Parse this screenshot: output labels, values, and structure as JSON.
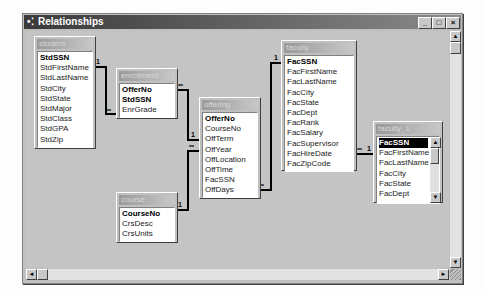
{
  "window": {
    "title": "Relationships",
    "controls": {
      "minimize": "_",
      "maximize": "□",
      "close": "×"
    }
  },
  "tables": {
    "student": {
      "title": "student",
      "fields": [
        "StdSSN",
        "StdFirstName",
        "StdLastName",
        "StdCity",
        "StdState",
        "StdMajor",
        "StdClass",
        "StdGPA",
        "StdZip"
      ]
    },
    "enrollment": {
      "title": "enrollment",
      "fields": [
        "OfferNo",
        "StdSSN",
        "EnrGrade"
      ]
    },
    "offering": {
      "title": "offering",
      "fields": [
        "OfferNo",
        "CourseNo",
        "OffTerm",
        "OffYear",
        "OffLocation",
        "OffTime",
        "FacSSN",
        "OffDays"
      ]
    },
    "faculty": {
      "title": "faculty",
      "fields": [
        "FacSSN",
        "FacFirstName",
        "FacLastName",
        "FacCity",
        "FacState",
        "FacDept",
        "FacRank",
        "FacSalary",
        "FacSupervisor",
        "FacHireDate",
        "FacZipCode"
      ]
    },
    "faculty_1": {
      "title": "faculty_1",
      "fields": [
        "FacSSN",
        "FacFirstName",
        "FacLastName",
        "FacCity",
        "FacState",
        "FacDept"
      ]
    },
    "course": {
      "title": "course",
      "fields": [
        "CourseNo",
        "CrsDesc",
        "CrsUnits"
      ]
    }
  },
  "relationships": [
    {
      "from": "student.StdSSN",
      "to": "enrollment.StdSSN",
      "from_card": "1",
      "to_card": "∞"
    },
    {
      "from": "offering.OfferNo",
      "to": "enrollment.OfferNo",
      "from_card": "1",
      "to_card": "∞"
    },
    {
      "from": "course.CourseNo",
      "to": "offering.CourseNo",
      "from_card": "1",
      "to_card": "∞"
    },
    {
      "from": "faculty.FacSSN",
      "to": "offering.FacSSN",
      "from_card": "1",
      "to_card": "∞"
    },
    {
      "from": "faculty_1.FacSSN",
      "to": "faculty.FacSupervisor",
      "from_card": "1",
      "to_card": "∞"
    }
  ],
  "cardinality": {
    "one": "1",
    "many": "∞"
  },
  "scroll": {
    "up": "▲",
    "down": "▼",
    "left": "◄",
    "right": "►"
  }
}
